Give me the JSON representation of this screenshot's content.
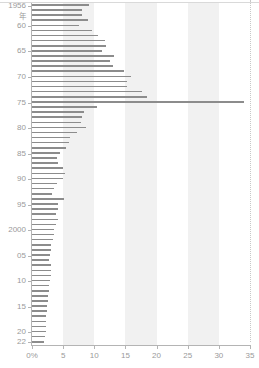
{
  "chart_data": {
    "type": "bar",
    "orientation": "horizontal",
    "title": "",
    "xlabel": "",
    "ylabel": "",
    "xlim": [
      0,
      35
    ],
    "xticks": [
      0,
      5,
      10,
      15,
      20,
      25,
      30,
      35
    ],
    "xtick_labels": [
      "0%",
      "5",
      "10",
      "15",
      "20",
      "25",
      "30",
      "35"
    ],
    "ytick_years": [
      1956,
      1960,
      1965,
      1970,
      1975,
      1980,
      1985,
      1990,
      1995,
      2000,
      2005,
      2010,
      2015,
      2020,
      2022
    ],
    "ytick_labels": [
      "1956",
      "60",
      "65",
      "70",
      "75",
      "80",
      "85",
      "90",
      "95",
      "2000",
      "05",
      "10",
      "15",
      "20",
      "22"
    ],
    "year_unit_label": "年",
    "grid": false,
    "bands": [
      {
        "from": 5,
        "to": 10
      },
      {
        "from": 15,
        "to": 20
      },
      {
        "from": 25,
        "to": 30
      }
    ],
    "band_color": "#eeeeee",
    "bar_color": "#8c8c8c",
    "axis_color": "#b4b4b4",
    "tick_text_color": "#9a9a9a",
    "categories": [
      1956,
      1957,
      1958,
      1959,
      1960,
      1961,
      1962,
      1963,
      1964,
      1965,
      1966,
      1967,
      1968,
      1969,
      1970,
      1971,
      1972,
      1973,
      1974,
      1975,
      1976,
      1977,
      1978,
      1979,
      1980,
      1981,
      1982,
      1983,
      1984,
      1985,
      1986,
      1987,
      1988,
      1989,
      1990,
      1991,
      1992,
      1993,
      1994,
      1995,
      1996,
      1997,
      1998,
      1999,
      2000,
      2001,
      2002,
      2003,
      2004,
      2005,
      2006,
      2007,
      2008,
      2009,
      2010,
      2011,
      2012,
      2013,
      2014,
      2015,
      2016,
      2017,
      2018,
      2019,
      2020,
      2021,
      2022
    ],
    "values": [
      9.2,
      8.0,
      8.0,
      9.0,
      7.6,
      9.6,
      10.6,
      11.7,
      11.9,
      11.3,
      13.1,
      12.6,
      13.0,
      14.7,
      15.9,
      15.3,
      15.3,
      17.6,
      18.4,
      34.0,
      10.5,
      8.3,
      8.0,
      7.9,
      8.6,
      7.3,
      6.1,
      5.9,
      5.4,
      4.5,
      4.0,
      4.2,
      5.0,
      5.3,
      5.0,
      4.0,
      3.5,
      3.2,
      5.1,
      4.2,
      4.1,
      3.8,
      4.2,
      3.8,
      3.6,
      3.5,
      3.4,
      3.1,
      3.0,
      2.9,
      2.8,
      3.0,
      3.1,
      3.0,
      2.9,
      2.8,
      2.7,
      2.6,
      2.5,
      2.4,
      2.4,
      2.3,
      2.3,
      2.2,
      2.2,
      2.1,
      2.0
    ]
  }
}
